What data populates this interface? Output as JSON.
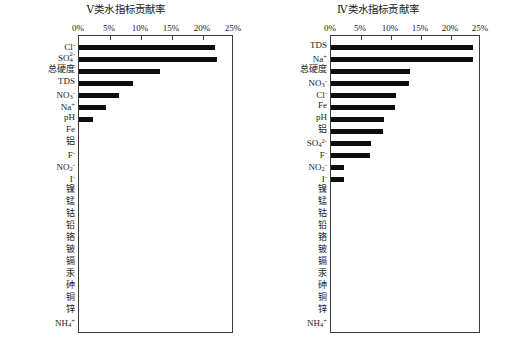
{
  "figure": {
    "axis_ticks": [
      "0%",
      "5%",
      "10%",
      "15%",
      "20%",
      "25%"
    ],
    "axis_tick_values": [
      0,
      5,
      10,
      15,
      20,
      25
    ],
    "bar_color": "#0d0d0d",
    "frame_color": "#3a3a3a",
    "background": "#ffffff"
  },
  "panels": [
    {
      "id": "panel-v",
      "title": "Ⅴ类水指标贡献率"
    },
    {
      "id": "panel-iv",
      "title": "Ⅳ类水指标贡献率"
    }
  ],
  "chart_data": [
    {
      "type": "bar",
      "orientation": "horizontal",
      "title": "Ⅴ类水指标贡献率",
      "xlabel": "",
      "ylabel": "",
      "xlim": [
        0,
        25
      ],
      "xticks": [
        0,
        5,
        10,
        15,
        20,
        25
      ],
      "xticklabels": [
        "0%",
        "5%",
        "10%",
        "15%",
        "20%",
        "25%"
      ],
      "grid": false,
      "legend": "none",
      "categories": [
        "Cl⁻",
        "SO₄²⁻",
        "总硬度",
        "TDS",
        "NO₃⁻",
        "Na⁺",
        "pH",
        "Fe",
        "铝",
        "F⁻",
        "NO₂⁻",
        "I⁻",
        "镍",
        "锰",
        "钴",
        "铅",
        "铬",
        "铍",
        "镉",
        "汞",
        "砷",
        "铜",
        "锌",
        "NH₄⁺"
      ],
      "values": [
        22.0,
        22.2,
        13.0,
        8.7,
        6.5,
        4.4,
        2.3,
        0,
        0,
        0,
        0,
        0,
        0,
        0,
        0,
        0,
        0,
        0,
        0,
        0,
        0,
        0,
        0,
        0
      ]
    },
    {
      "type": "bar",
      "orientation": "horizontal",
      "title": "Ⅳ类水指标贡献率",
      "xlabel": "",
      "ylabel": "",
      "xlim": [
        0,
        25
      ],
      "xticks": [
        0,
        5,
        10,
        15,
        20,
        25
      ],
      "xticklabels": [
        "0%",
        "5%",
        "10%",
        "15%",
        "20%",
        "25%"
      ],
      "grid": false,
      "legend": "none",
      "categories": [
        "TDS",
        "Na⁺",
        "总硬度",
        "NO₃⁻",
        "Cl⁻",
        "Fe",
        "pH",
        "铝",
        "SO₄²⁻",
        "F⁻",
        "NO₂⁻",
        "I⁻",
        "镍",
        "锰",
        "钴",
        "铅",
        "铬",
        "铍",
        "镉",
        "汞",
        "砷",
        "铜",
        "锌",
        "NH₄⁺"
      ],
      "values": [
        23.7,
        23.6,
        13.1,
        13.0,
        10.8,
        10.7,
        8.8,
        8.7,
        6.6,
        6.5,
        2.2,
        2.2,
        0,
        0,
        0,
        0,
        0,
        0,
        0,
        0,
        0,
        0,
        0,
        0
      ]
    }
  ],
  "labels_html": {
    "left": [
      "Cl<sup>-</sup>",
      "SO<span class=\"ion\"></span><span class=\"stack\">2-<br>4</span>",
      "总硬度",
      "TDS",
      "NO<span class=\"stack\"><br>3</span><sup>-</sup>",
      "Na<sup>+</sup>",
      "pH",
      "Fe",
      "铝",
      "F<sup>-</sup>",
      "NO<sub>2</sub><sup>-</sup>",
      "I<sup>-</sup>",
      "镍",
      "锰",
      "钴",
      "铅",
      "铬",
      "铍",
      "镉",
      "汞",
      "砷",
      "铜",
      "锌",
      "NH<sub>4</sub><sup>+</sup>"
    ],
    "right": [
      "TDS",
      "Na<sup>+</sup>",
      "总硬度",
      "NO<sub>3</sub><sup>-</sup>",
      "Cl<sup>-</sup>",
      "Fe",
      "pH",
      "铝",
      "SO<sub>4</sub><sup>2-</sup>",
      "F<sup>-</sup>",
      "NO<sub>2</sub><sup>-</sup>",
      "I<sup>-</sup>",
      "镍",
      "锰",
      "钴",
      "铅",
      "铬",
      "铍",
      "镉",
      "汞",
      "砷",
      "铜",
      "锌",
      "NH<sub>4</sub><sup>+</sup>"
    ]
  }
}
